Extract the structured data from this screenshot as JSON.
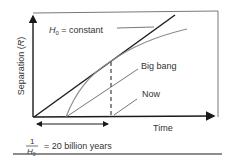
{
  "diagram": {
    "y_axis_label": "Separation (",
    "y_axis_label_var": "R",
    "y_axis_label_close": ")",
    "x_axis_label": "Time",
    "h0_label_var": "H",
    "h0_label_sub": "0",
    "h0_label_rest": " = constant",
    "big_bang_label": "Big bang",
    "now_label": "Now",
    "fraction_numerator": "1",
    "fraction_denominator_var": "H",
    "fraction_denominator_sub": "0",
    "fraction_value": "= 20 billion years",
    "colors": {
      "axis": "#1a1a1a",
      "constant_line": "#1a1a1a",
      "curve": "#8a8a8a",
      "pointer": "#555555",
      "frame": "#333333",
      "text": "#333333"
    }
  }
}
